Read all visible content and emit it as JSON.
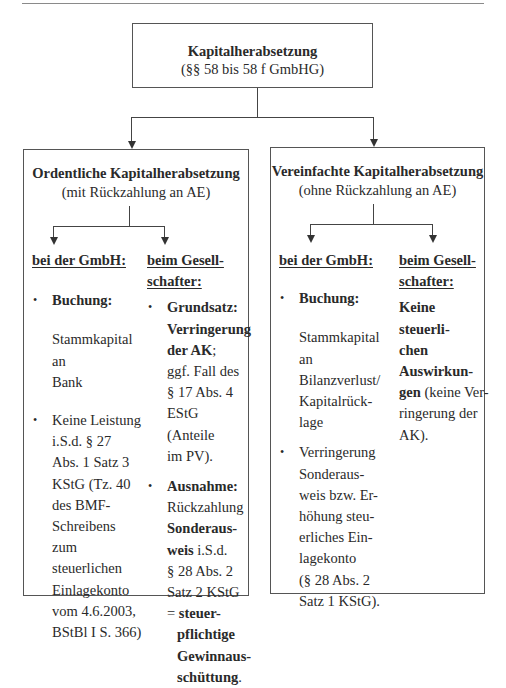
{
  "page": {
    "header_rule": true
  },
  "root": {
    "title": "Kapitalherabsetzung",
    "subtitle": "(§§ 58 bis 58 f GmbHG)"
  },
  "left": {
    "title": "Ordentliche Kapitalherabsetzung",
    "subtitle": "(mit Rückzahlung an AE)",
    "gmbh": {
      "header": "bei der GmbH:",
      "bullet1_label": "Buchung:",
      "booking_lines": [
        "Stammkapital",
        "an",
        "Bank"
      ],
      "bullet2_lines": [
        "Keine Leistung",
        "i.S.d. § 27",
        "Abs. 1 Satz 3",
        "KStG (Tz. 40",
        "des BMF-",
        "Schreibens zum",
        "steuerlichen",
        "Einlagekonto",
        "vom 4.6.2003,",
        "BStBl I S. 366)"
      ]
    },
    "shareholder": {
      "header_lines": [
        "beim Gesell-",
        "schafter:"
      ],
      "bullet1_bold_lines": [
        "Grundsatz:",
        "Verringerung",
        "der AK"
      ],
      "bullet1_bold_suffix": ";",
      "bullet1_rest_lines": [
        "ggf. Fall des",
        "§ 17 Abs. 4",
        "EStG (Anteile",
        "im PV)."
      ],
      "bullet2_bold": "Ausnahme:",
      "bullet2_line": "Rückzahlung",
      "bullet2_bold2": "Sonderaus-",
      "bullet2_bold3": "weis",
      "bullet2_after3": " i.S.d.",
      "bullet2_lines": [
        "§ 28 Abs. 2",
        "Satz 2 KStG"
      ],
      "result_prefix": "= ",
      "result_bold_lines": [
        "steuer-",
        "pflichtige",
        "Gewinnaus-",
        "schüttung"
      ],
      "result_suffix": "."
    }
  },
  "right": {
    "title": "Vereinfachte Kapitalherabsetzung",
    "subtitle": "(ohne Rückzahlung an AE)",
    "gmbh": {
      "header": "bei der GmbH:",
      "bullet1_label": "Buchung:",
      "booking_lines": [
        "Stammkapital",
        "an",
        "Bilanzverlust/",
        "Kapitalrück-",
        "lage"
      ],
      "bullet2_lines": [
        "Verringerung",
        "Sonderaus-",
        "weis bzw. Er-",
        "höhung steu-",
        "erliches Ein-",
        "lagekonto",
        "(§ 28 Abs. 2",
        "Satz 1 KStG)."
      ]
    },
    "shareholder": {
      "header_lines": [
        "beim Gesell-",
        "schafter:"
      ],
      "bold_lines": [
        "Keine steuerli-",
        "chen Auswirkun-",
        "gen"
      ],
      "rest_first": " (keine Ver-",
      "rest_lines": [
        "ringerung der",
        "AK)."
      ]
    }
  }
}
